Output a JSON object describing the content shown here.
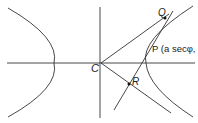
{
  "diagram": {
    "labels": {
      "C": "C",
      "Q": "Q",
      "P": "P (a secφ,",
      "R": "R"
    },
    "colors": {
      "stroke": "#333333",
      "background": "#ffffff"
    }
  }
}
